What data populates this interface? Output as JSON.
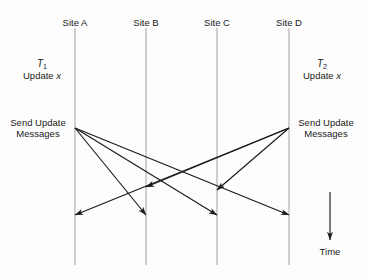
{
  "figure": {
    "background_color": "#fdfdfd",
    "line_color": "#aaaaaa",
    "arrow_color": "#1a1a1a",
    "text_color": "#1a1a1a"
  },
  "sites": [
    {
      "label": "Site A",
      "x": 75,
      "line_top": 28,
      "line_bottom": 265
    },
    {
      "label": "Site B",
      "x": 146,
      "line_top": 28,
      "line_bottom": 265
    },
    {
      "label": "Site C",
      "x": 217,
      "line_top": 28,
      "line_bottom": 265
    },
    {
      "label": "Site D",
      "x": 289,
      "line_top": 28,
      "line_bottom": 265
    }
  ],
  "site_label_y": 17,
  "transactions": [
    {
      "name": "T",
      "subscript": "1",
      "operation": "Update ",
      "variable": "x",
      "x": 42,
      "y": 58
    },
    {
      "name": "T",
      "subscript": "2",
      "operation": "Update ",
      "variable": "x",
      "x": 322,
      "y": 58
    }
  ],
  "send_labels": [
    {
      "line1": "Send Update",
      "line2": "Messages",
      "x": 38,
      "y": 128
    },
    {
      "line1": "Send Update",
      "line2": "Messages",
      "x": 326,
      "y": 128
    }
  ],
  "messages": [
    {
      "from": "Site A",
      "to": "Site B",
      "x1": 75,
      "y1": 128,
      "x2": 146,
      "y2": 215
    },
    {
      "from": "Site A",
      "to": "Site C",
      "x1": 75,
      "y1": 128,
      "x2": 217,
      "y2": 215
    },
    {
      "from": "Site A",
      "to": "Site D",
      "x1": 75,
      "y1": 128,
      "x2": 289,
      "y2": 215
    },
    {
      "from": "Site D",
      "to": "Site C",
      "x1": 289,
      "y1": 128,
      "x2": 217,
      "y2": 190
    },
    {
      "from": "Site D",
      "to": "Site B",
      "x1": 289,
      "y1": 128,
      "x2": 146,
      "y2": 187
    },
    {
      "from": "Site D",
      "to": "Site A",
      "x1": 289,
      "y1": 128,
      "x2": 75,
      "y2": 215
    }
  ],
  "time_axis": {
    "label": "Time",
    "x": 330,
    "y_start": 192,
    "y_end": 240,
    "label_y": 246
  }
}
